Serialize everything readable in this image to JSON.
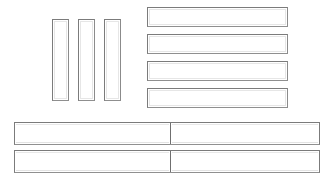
{
  "canvas": {
    "width": 335,
    "height": 181,
    "background": "#ffffff",
    "border_color": "#7b7b7b",
    "inner_highlight_color": "#e6e6e6"
  },
  "vertical_boxes": [
    {
      "name": "vertical-box-1",
      "label": "",
      "x": 52,
      "y": 19,
      "width": 17,
      "height": 82
    },
    {
      "name": "vertical-box-2",
      "label": "",
      "x": 78,
      "y": 19,
      "width": 17,
      "height": 82
    },
    {
      "name": "vertical-box-3",
      "label": "",
      "x": 104,
      "y": 19,
      "width": 17,
      "height": 82
    }
  ],
  "horizontal_boxes": [
    {
      "name": "horizontal-box-1",
      "label": "",
      "x": 147,
      "y": 7,
      "width": 141,
      "height": 20
    },
    {
      "name": "horizontal-box-2",
      "label": "",
      "x": 147,
      "y": 34,
      "width": 141,
      "height": 20
    },
    {
      "name": "horizontal-box-3",
      "label": "",
      "x": 147,
      "y": 61,
      "width": 141,
      "height": 20
    },
    {
      "name": "horizontal-box-4",
      "label": "",
      "x": 147,
      "y": 88,
      "width": 141,
      "height": 20
    }
  ],
  "wide_bars": [
    {
      "name": "wide-bar-1",
      "x": 14,
      "y": 122,
      "width": 306,
      "height": 23,
      "cells": [
        {
          "name": "wide-bar-1-cell-left",
          "label": "",
          "width": 157
        },
        {
          "name": "wide-bar-1-cell-right",
          "label": "",
          "width": 149
        }
      ]
    },
    {
      "name": "wide-bar-2",
      "x": 14,
      "y": 150,
      "width": 306,
      "height": 23,
      "cells": [
        {
          "name": "wide-bar-2-cell-left",
          "label": "",
          "width": 157
        },
        {
          "name": "wide-bar-2-cell-right",
          "label": "",
          "width": 149
        }
      ]
    }
  ]
}
